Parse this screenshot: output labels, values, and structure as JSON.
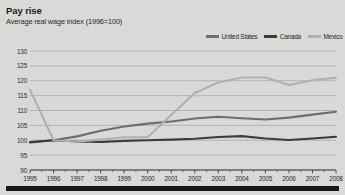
{
  "header": {
    "title": "Pay rise",
    "subtitle": "Average real wage index (1996=100)"
  },
  "legend": {
    "position": "top-right",
    "items": [
      {
        "label": "United States",
        "color": "#6e6e6e"
      },
      {
        "label": "Canada",
        "color": "#3c3c3c"
      },
      {
        "label": "Mexico",
        "color": "#b0b0ae"
      }
    ]
  },
  "colors": {
    "background": "#d9d9d7",
    "gridline": "#a9a9a6",
    "axis": "#3c3c3c",
    "text": "#1f1f1f",
    "bottom_bar": "#17171a"
  },
  "chart_data": {
    "type": "line",
    "title": "Pay rise",
    "subtitle": "Average real wage index (1996=100)",
    "xlabel": "",
    "ylabel": "",
    "grid": true,
    "legend_position": "top-right",
    "x": [
      1995,
      1996,
      1997,
      1998,
      1999,
      2000,
      2001,
      2002,
      2003,
      2004,
      2005,
      2006,
      2007,
      2008
    ],
    "categories": [
      "1995",
      "1996",
      "1997",
      "1998",
      "1999",
      "2000",
      "2001",
      "2002",
      "2003",
      "2004",
      "2005",
      "2006",
      "2007",
      "2008"
    ],
    "xlim": [
      1995,
      2008
    ],
    "ylim": [
      90,
      130
    ],
    "yticks": [
      90,
      95,
      100,
      105,
      110,
      115,
      120,
      125,
      130
    ],
    "series": [
      {
        "name": "United States",
        "color": "#6e6e6e",
        "values": [
          99.4,
          100.0,
          101.3,
          103.2,
          104.6,
          105.6,
          106.3,
          107.3,
          107.9,
          107.4,
          107.0,
          107.6,
          108.6,
          109.6
        ]
      },
      {
        "name": "Canada",
        "color": "#3c3c3c",
        "values": [
          99.3,
          100.0,
          99.6,
          99.4,
          99.8,
          100.0,
          100.2,
          100.5,
          101.1,
          101.4,
          100.6,
          100.1,
          100.6,
          101.2
        ]
      },
      {
        "name": "Mexico",
        "color": "#b0b0ae",
        "values": [
          117.0,
          100.0,
          99.6,
          100.2,
          101.0,
          101.0,
          108.5,
          115.9,
          119.4,
          121.1,
          121.1,
          118.6,
          120.2,
          121.0
        ]
      }
    ]
  }
}
